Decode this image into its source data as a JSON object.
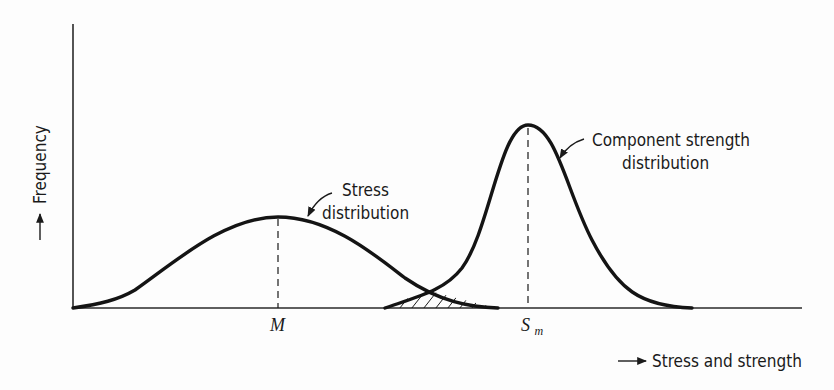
{
  "figure": {
    "type": "stress-strength interference diagram",
    "y_axis_label": "Frequency",
    "x_axis_label": "Stress and strength",
    "stress_curve": {
      "label_line1": "Stress",
      "label_line2": "distribution",
      "mean_label": "M"
    },
    "strength_curve": {
      "label_line1": "Component strength",
      "label_line2": "distribution",
      "mean_label_main": "S",
      "mean_label_sub": "m"
    },
    "overlap_region": "hatched interference area"
  },
  "colors": {
    "ink": "#141414",
    "background": "#fdfdfd"
  }
}
